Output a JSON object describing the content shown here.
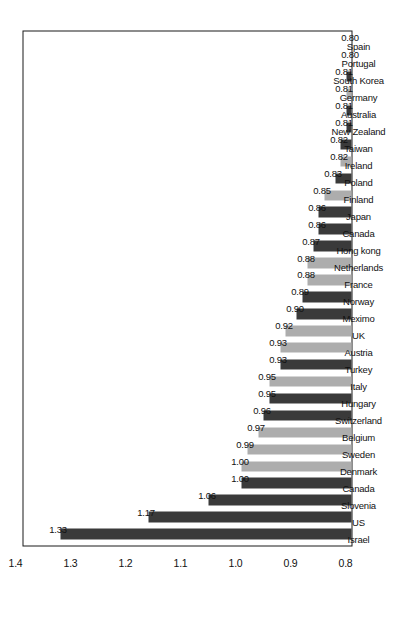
{
  "chart_data": {
    "type": "bar",
    "title": "",
    "subtitle": "",
    "xlabel": "",
    "ylabel": "",
    "ylim": [
      0.8,
      1.4
    ],
    "yticks": [
      "0.8",
      "0.9",
      "1.0",
      "1.1",
      "1.2",
      "1.3",
      "1.4"
    ],
    "grid": false,
    "legend": "none",
    "orientation": "vertical-bars-rotated-90ccw",
    "value_label_format": "2dp",
    "categories": [
      "Israel",
      "US",
      "Slovenia",
      "Canada",
      "Denmark",
      "Sweden",
      "Belgium",
      "Switzerland",
      "Hungary",
      "Italy",
      "Turkey",
      "Austria",
      "UK",
      "Meximo",
      "Norway",
      "France",
      "Netherlands",
      "Hong kong",
      "Canada",
      "Japan",
      "Finland",
      "Poland",
      "Ireland",
      "Taiwan",
      "New Zealand",
      "Australia",
      "Germany",
      "South Korea",
      "Portugal",
      "Spain"
    ],
    "values": [
      1.33,
      1.17,
      1.06,
      1.0,
      1.0,
      0.99,
      0.97,
      0.96,
      0.95,
      0.95,
      0.93,
      0.93,
      0.92,
      0.9,
      0.89,
      0.88,
      0.88,
      0.87,
      0.86,
      0.86,
      0.85,
      0.83,
      0.82,
      0.82,
      0.81,
      0.81,
      0.81,
      0.81,
      0.8,
      0.8
    ],
    "value_labels": [
      "1.33",
      "1.17",
      "1.06",
      "1.00",
      "1.00",
      "0.99",
      "0.97",
      "0.96",
      "0.95",
      "0.95",
      "0.93",
      "0.93",
      "0.92",
      "0.90",
      "0.89",
      "0.88",
      "0.88",
      "0.87",
      "0.86",
      "0.86",
      "0.85",
      "0.83",
      "0.82",
      "0.82",
      "0.81",
      "0.81",
      "0.81",
      "0.81",
      "0.80",
      "0.80"
    ],
    "bar_shades": [
      "dark",
      "dark",
      "dark",
      "dark",
      "light",
      "light",
      "light",
      "dark",
      "dark",
      "light",
      "dark",
      "light",
      "light",
      "dark",
      "dark",
      "light",
      "light",
      "dark",
      "dark",
      "dark",
      "light",
      "dark",
      "light",
      "dark",
      "dark",
      "dark",
      "light",
      "dark",
      "light",
      "light"
    ],
    "colors": {
      "bar_dark": "#3a3a3a",
      "bar_light": "#adadad",
      "axis": "#1a1a1a",
      "text": "#111111",
      "background": "#ffffff"
    }
  }
}
